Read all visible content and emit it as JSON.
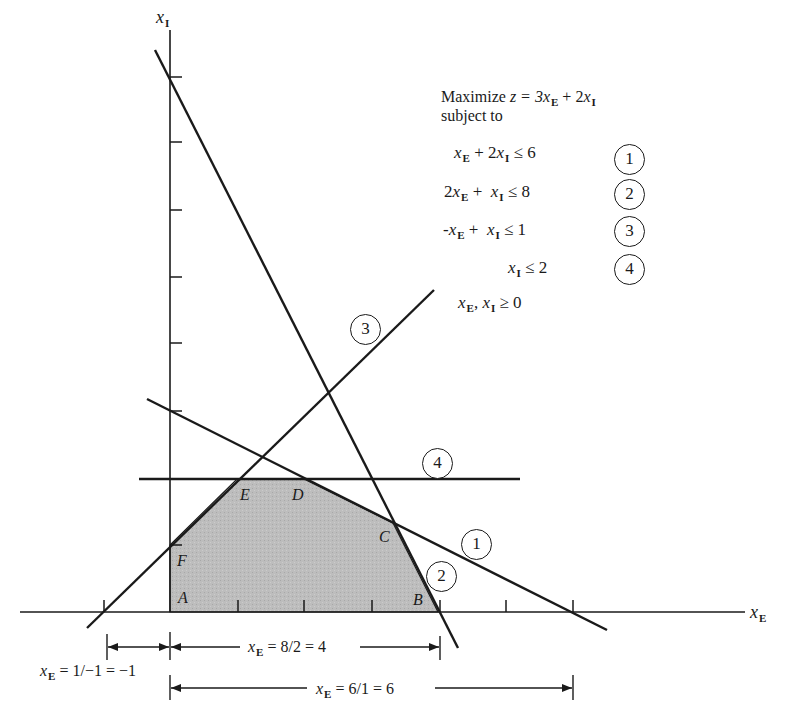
{
  "axes": {
    "x_label": "x",
    "x_label_sub": "E",
    "y_label": "x",
    "y_label_sub": "I"
  },
  "problem": {
    "objective_prefix": "Maximize ",
    "objective": "z = 3x_E + 2x_I",
    "objective_parts": [
      "z = 3",
      "x",
      "E",
      " + 2",
      "x",
      "I"
    ],
    "subject_to": "subject to",
    "constraints": [
      {
        "id": "1",
        "lhs": "x_E + 2x_I",
        "op": "≤",
        "rhs": "6",
        "parts": [
          "",
          "x",
          "E",
          " + 2",
          "x",
          "I",
          " ≤ 6"
        ]
      },
      {
        "id": "2",
        "lhs": "2x_E + x_I",
        "op": "≤",
        "rhs": "8",
        "parts": [
          "2",
          "x",
          "E",
          " +  ",
          "x",
          "I",
          " ≤ 8"
        ]
      },
      {
        "id": "3",
        "lhs": "-x_E + x_I",
        "op": "≤",
        "rhs": "1",
        "parts": [
          "-",
          "x",
          "E",
          " +  ",
          "x",
          "I",
          " ≤ 1"
        ]
      },
      {
        "id": "4",
        "lhs": "x_I",
        "op": "≤",
        "rhs": "2",
        "parts": [
          "",
          "",
          "",
          "",
          "x",
          "I",
          " ≤ 2"
        ]
      }
    ],
    "nonneg": {
      "parts": [
        "x",
        "E",
        ", ",
        "x",
        "I",
        " ≥ 0"
      ]
    }
  },
  "line_labels": [
    "1",
    "2",
    "3",
    "4"
  ],
  "vertices": [
    {
      "name": "A",
      "xE": 0,
      "xI": 0
    },
    {
      "name": "B",
      "xE": 4,
      "xI": 0
    },
    {
      "name": "C",
      "xE": 3.333,
      "xI": 1.333
    },
    {
      "name": "D",
      "xE": 2,
      "xI": 2
    },
    {
      "name": "E",
      "xE": 1,
      "xI": 2
    },
    {
      "name": "F",
      "xE": 0,
      "xI": 1
    }
  ],
  "intercept_annotations": [
    {
      "text_prefix": "x",
      "sub": "E",
      "text": " = 1/−1 = −1",
      "value": -1
    },
    {
      "text_prefix": "x",
      "sub": "E",
      "text": " = 8/2 = 4",
      "value": 4
    },
    {
      "text_prefix": "x",
      "sub": "E",
      "text": " = 6/1 = 6",
      "value": 6
    }
  ],
  "ticks": {
    "x": [
      -1,
      1,
      2,
      3,
      4,
      5,
      6
    ],
    "y": [
      1,
      2,
      3,
      4,
      5,
      6,
      7,
      8
    ]
  },
  "colors": {
    "ink": "#1a1a1a",
    "feasible_fill": "#b9b9b9",
    "background": "#ffffff"
  }
}
